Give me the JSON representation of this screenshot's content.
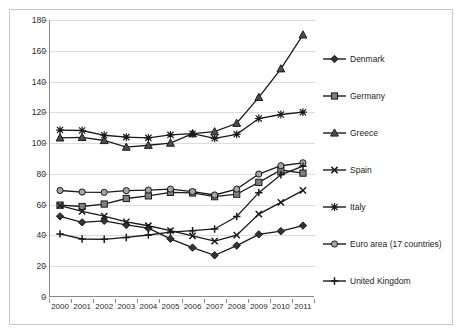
{
  "chart_data": {
    "type": "line",
    "title": "",
    "xlabel": "",
    "ylabel": "",
    "grid": true,
    "legend_position": "right",
    "categories": [
      "2000",
      "2001",
      "2002",
      "2003",
      "2004",
      "2005",
      "2006",
      "2007",
      "2008",
      "2009",
      "2010",
      "2011"
    ],
    "x": [
      2000,
      2001,
      2002,
      2003,
      2004,
      2005,
      2006,
      2007,
      2008,
      2009,
      2010,
      2011
    ],
    "ylim": [
      0,
      180
    ],
    "yticks": [
      0,
      20,
      40,
      60,
      80,
      100,
      120,
      140,
      160,
      180
    ],
    "series": [
      {
        "name": "Denmark",
        "marker": "diamond",
        "color": "#333333",
        "values": [
          52.4,
          48.5,
          49.5,
          46.8,
          44.7,
          37.8,
          32.1,
          27.1,
          33.4,
          40.7,
          42.8,
          46.4
        ]
      },
      {
        "name": "Germany",
        "marker": "square",
        "color": "#808080",
        "values": [
          59.7,
          58.8,
          60.4,
          64.0,
          65.7,
          68.0,
          67.6,
          65.2,
          66.8,
          74.5,
          82.5,
          80.5
        ]
      },
      {
        "name": "Greece",
        "marker": "triangle",
        "color": "#4d4d4d",
        "values": [
          103.4,
          103.7,
          101.7,
          97.4,
          98.6,
          100.0,
          106.1,
          107.4,
          112.9,
          129.7,
          148.3,
          170.3
        ]
      },
      {
        "name": "Spain",
        "marker": "x",
        "color": "#1a1a1a",
        "values": [
          59.4,
          55.6,
          52.6,
          48.8,
          46.3,
          43.2,
          39.7,
          36.3,
          40.2,
          53.9,
          61.5,
          69.3
        ]
      },
      {
        "name": "Italy",
        "marker": "asterisk",
        "color": "#1a1a1a",
        "values": [
          108.5,
          108.2,
          105.1,
          103.9,
          103.4,
          105.4,
          106.1,
          103.1,
          105.7,
          116.0,
          118.6,
          120.1
        ]
      },
      {
        "name": "Euro area (17 countries)",
        "marker": "circle",
        "color": "#a6a6a6",
        "values": [
          69.2,
          68.2,
          68.0,
          69.1,
          69.5,
          70.1,
          68.5,
          66.3,
          70.1,
          79.9,
          85.3,
          87.2
        ]
      },
      {
        "name": "United Kingdom",
        "marker": "plus",
        "color": "#1a1a1a",
        "values": [
          41.0,
          37.7,
          37.5,
          38.7,
          40.3,
          42.1,
          43.1,
          44.2,
          52.3,
          67.8,
          79.4,
          85.0
        ]
      }
    ]
  },
  "legend": {
    "items": [
      {
        "label": "Denmark",
        "marker": "diamond"
      },
      {
        "label": "Germany",
        "marker": "square"
      },
      {
        "label": "Greece",
        "marker": "triangle"
      },
      {
        "label": "Spain",
        "marker": "x"
      },
      {
        "label": "Italy",
        "marker": "asterisk"
      },
      {
        "label": "Euro area (17 countries)",
        "marker": "circle"
      },
      {
        "label": "United Kingdom",
        "marker": "plus"
      }
    ]
  },
  "colors": {
    "axis": "#8a8a8a",
    "grid": "#dcdcdc",
    "frame": "#c8c8c8",
    "line": "#1a1a1a",
    "background": "#ffffff"
  }
}
